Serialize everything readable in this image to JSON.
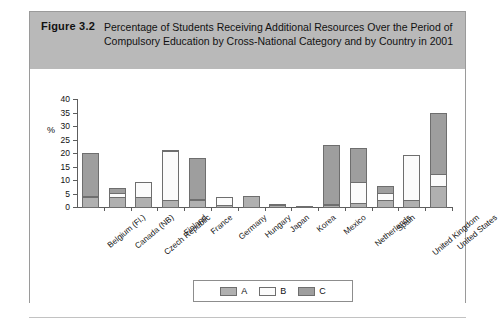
{
  "figure": {
    "number": "Figure 3.2",
    "title": "Percentage of Students Receiving Additional Resources Over the Period of Compulsory Education by Cross-National Category and by Country in 2001"
  },
  "axis": {
    "y_unit_label": "%",
    "y_ticks": [
      "0",
      "5",
      "10",
      "15",
      "20",
      "25",
      "30",
      "35",
      "40"
    ]
  },
  "legend": {
    "items": [
      {
        "label": "A",
        "color": "#b0b0b0"
      },
      {
        "label": "B",
        "color": "#fbfbfb"
      },
      {
        "label": "C",
        "color": "#9e9e9e"
      }
    ]
  },
  "chart_data": {
    "type": "bar",
    "stacked": true,
    "title": "Percentage of Students Receiving Additional Resources Over the Period of Compulsory Education by Cross-National Category and by Country in 2001",
    "xlabel": "",
    "ylabel": "%",
    "ylim": [
      0,
      40
    ],
    "ytick_step": 5,
    "grid": false,
    "legend_position": "bottom-center",
    "categories": [
      "Belgium (Fl.)",
      "Canada (NB)",
      "Czech Republic",
      "Finland",
      "France",
      "Germany",
      "Hungary",
      "Japan",
      "Korea",
      "Mexico",
      "Netherlands",
      "Spain",
      "United Kingdom",
      "United States"
    ],
    "series": [
      {
        "name": "A",
        "color": "#b0b0b0",
        "values": [
          4,
          4,
          4,
          3,
          3,
          1,
          4.5,
          1,
          0.5,
          1,
          2,
          3,
          3,
          8
        ]
      },
      {
        "name": "B",
        "color": "#fbfbfb",
        "values": [
          1,
          2,
          6,
          18.5,
          0.5,
          3.5,
          0,
          0.5,
          0,
          0.5,
          8,
          3,
          17,
          5
        ]
      },
      {
        "name": "C",
        "color": "#9e9e9e",
        "values": [
          16,
          2,
          0,
          0.5,
          15.5,
          0,
          0,
          0,
          0,
          22.5,
          13,
          3,
          0,
          23
        ]
      }
    ],
    "totals": [
      21,
      8,
      10,
      22,
      19,
      4.5,
      4.5,
      1.5,
      0.5,
      24,
      23,
      9,
      20,
      36
    ]
  }
}
